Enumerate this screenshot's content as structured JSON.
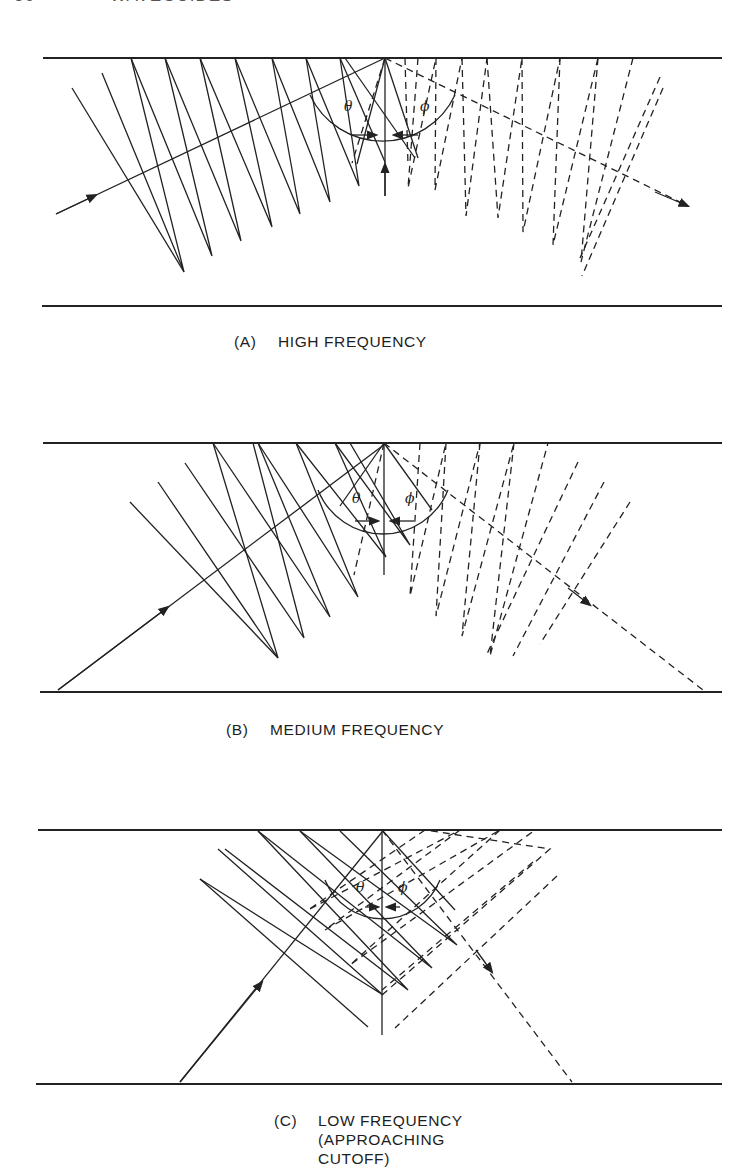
{
  "page_header": {
    "page_number": "56",
    "running_title": "WAVEGUIDES"
  },
  "panels": [
    {
      "id": "A",
      "label": "(A)",
      "caption_lines": [
        "HIGH FREQUENCY"
      ],
      "angle_symbols": {
        "incident": "θ",
        "reflected": "ϕ"
      },
      "legend": {
        "solid_lines": "incident wavefronts / ray",
        "dashed_lines": "reflected wavefronts / ray"
      }
    },
    {
      "id": "B",
      "label": "(B)",
      "caption_lines": [
        "MEDIUM FREQUENCY"
      ],
      "angle_symbols": {
        "incident": "θ",
        "reflected": "ϕ"
      }
    },
    {
      "id": "C",
      "label": "(C)",
      "caption_lines": [
        "LOW FREQUENCY",
        "(APPROACHING",
        "CUTOFF)"
      ],
      "angle_symbols": {
        "incident": "θ",
        "reflected": "ϕ"
      }
    }
  ],
  "colors": {
    "ink": "#222222",
    "background": "#ffffff"
  }
}
